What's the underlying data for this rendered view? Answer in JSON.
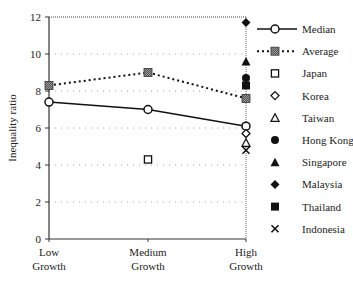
{
  "chart_data": {
    "type": "line",
    "title": "",
    "xlabel": "",
    "ylabel": "Inequality ratio",
    "ylim": [
      0,
      12
    ],
    "yticks": [
      0,
      2,
      4,
      6,
      8,
      10,
      12
    ],
    "grid": "horizontal dotted",
    "legend_position": "right",
    "categories": [
      "Low Growth",
      "Medium Growth",
      "High Growth"
    ],
    "category_lines": [
      [
        "Low",
        "Growth"
      ],
      [
        "Medium",
        "Growth"
      ],
      [
        "High",
        "Growth"
      ]
    ],
    "series": [
      {
        "name": "Median",
        "style": "solid-line-open-circle",
        "values": [
          7.4,
          7.0,
          6.1
        ]
      },
      {
        "name": "Average",
        "style": "dotted-line-hatched-square",
        "values": [
          8.3,
          9.0,
          7.6
        ]
      },
      {
        "name": "Japan",
        "style": "open-square",
        "values": [
          null,
          4.3,
          null
        ]
      },
      {
        "name": "Korea",
        "style": "open-diamond",
        "values": [
          null,
          null,
          5.7
        ]
      },
      {
        "name": "Taiwan",
        "style": "open-triangle",
        "values": [
          null,
          null,
          5.2
        ]
      },
      {
        "name": "Hong Kong",
        "style": "filled-circle",
        "values": [
          null,
          null,
          8.7
        ]
      },
      {
        "name": "Singapore",
        "style": "filled-triangle",
        "values": [
          null,
          null,
          9.6
        ]
      },
      {
        "name": "Malaysia",
        "style": "filled-diamond",
        "values": [
          null,
          null,
          11.7
        ]
      },
      {
        "name": "Thailand",
        "style": "filled-square",
        "values": [
          null,
          null,
          8.3
        ]
      },
      {
        "name": "Indonesia",
        "style": "x-mark",
        "values": [
          null,
          null,
          4.8
        ]
      }
    ]
  }
}
